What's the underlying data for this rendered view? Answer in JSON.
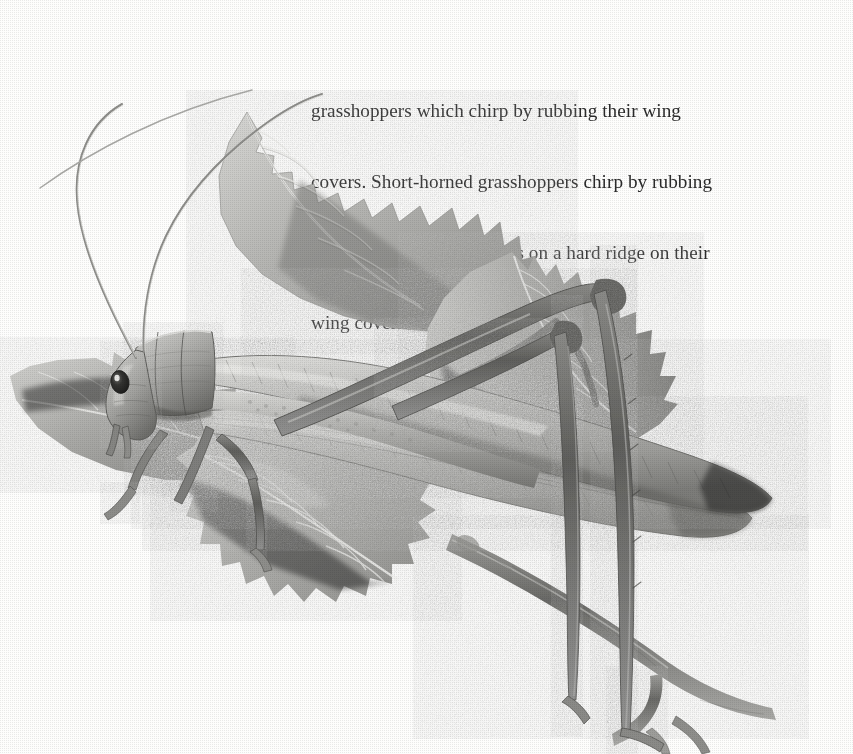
{
  "page": {
    "width": 853,
    "height": 754,
    "background_color": "#fdfdfc",
    "media_type": "scanned-book-page"
  },
  "caption": {
    "clipped_line_above": "                                                       ",
    "lines": [
      "grasshoppers which chirp by rubbing their wing",
      "covers. Short-horned grasshoppers chirp by rubbing",
      "the inside of their back legs on a hard ridge on their",
      "wing covers."
    ],
    "full_text": "grasshoppers which chirp by rubbing their wing covers. Short-horned grasshoppers chirp by rubbing the inside of their back legs on a hard ridge on their wing covers.",
    "text_color": "#2b2b2b"
  },
  "illustration": {
    "title": "Long-horned grasshopper (katydid) on leaves",
    "style": "grayscale halftone engraving",
    "subject": "long-horned-grasshopper",
    "palette": {
      "paper": "#fdfdfc",
      "light": "#dcdcda",
      "mid": "#b4b4b1",
      "mid_dark": "#969693",
      "dark": "#6e6e6b",
      "darkest": "#3f3f3d",
      "eye": "#242423",
      "highlight": "#f2f2f0"
    },
    "parts": [
      {
        "name": "antenna-left",
        "label": "left antenna"
      },
      {
        "name": "antenna-right",
        "label": "right antenna"
      },
      {
        "name": "head",
        "label": "head"
      },
      {
        "name": "eye",
        "label": "compound eye"
      },
      {
        "name": "mouthparts",
        "label": "mouthparts / palps"
      },
      {
        "name": "pronotum",
        "label": "pronotum (saddle)"
      },
      {
        "name": "wing-cover-upper",
        "label": "upper wing cover"
      },
      {
        "name": "wing-cover-lower",
        "label": "lower wing cover"
      },
      {
        "name": "abdomen",
        "label": "abdomen"
      },
      {
        "name": "hind-leg-femur",
        "label": "hind leg femur"
      },
      {
        "name": "hind-leg-tibia",
        "label": "hind leg tibia"
      },
      {
        "name": "middle-leg",
        "label": "middle leg"
      },
      {
        "name": "front-leg",
        "label": "front leg"
      },
      {
        "name": "leaf-upper",
        "label": "upper serrated leaf"
      },
      {
        "name": "leaf-right",
        "label": "right serrated leaf"
      },
      {
        "name": "leaf-left",
        "label": "left serrated leaf"
      },
      {
        "name": "leaf-lower",
        "label": "lower serrated leaf"
      },
      {
        "name": "branch",
        "label": "woody branch"
      }
    ]
  }
}
